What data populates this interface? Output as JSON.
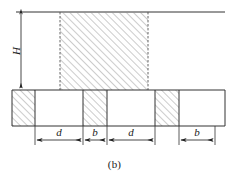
{
  "figure": {
    "caption": "(b)",
    "type": "engineering-cross-section-diagram",
    "colors": {
      "line": "#333333",
      "hatch": "#8f8f8f",
      "background": "#ffffff",
      "text": "#1a1a1a"
    },
    "dimensions": {
      "height_label": "H",
      "width_labels": [
        "d",
        "b",
        "d",
        "b"
      ]
    },
    "geometry": {
      "top_rule": {
        "x1": 16,
        "x2": 225,
        "y": 12
      },
      "column": {
        "x": 60,
        "y": 12,
        "width": 88,
        "height": 78
      },
      "strip": {
        "x": 12,
        "y": 90,
        "width": 213,
        "height": 36
      },
      "strip_segments": [
        {
          "x": 12,
          "width": 23,
          "hatched": true
        },
        {
          "x": 35,
          "width": 48,
          "hatched": false
        },
        {
          "x": 83,
          "width": 24,
          "hatched": true
        },
        {
          "x": 107,
          "width": 48,
          "hatched": false
        },
        {
          "x": 155,
          "width": 24,
          "hatched": true
        },
        {
          "x": 179,
          "width": 46,
          "hatched": false
        }
      ],
      "dim_line_y": 140,
      "dim_ticks": [
        35,
        83,
        107,
        155,
        179,
        215
      ],
      "vertical_dim": {
        "x": 21,
        "y1": 12,
        "y2": 90
      }
    }
  }
}
